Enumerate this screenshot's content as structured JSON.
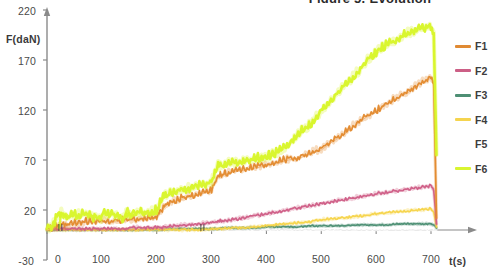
{
  "figure": {
    "title": "Figure 5. Evolution"
  },
  "axes": {
    "y_label": "F(daN)",
    "x_label": "t(s)",
    "y_ticks": [
      "220",
      "170",
      "120",
      "70",
      "20",
      "-30"
    ],
    "x_ticks": [
      "0",
      "100",
      "200",
      "300",
      "400",
      "500",
      "600",
      "700"
    ]
  },
  "legend": {
    "items": [
      {
        "label": "F1",
        "color": "#e08a33"
      },
      {
        "label": "F2",
        "color": "#cc5f86"
      },
      {
        "label": "F3",
        "color": "#4e8f74"
      },
      {
        "label": "F4",
        "color": "#f5d44f"
      },
      {
        "label": "F5",
        "color": "#ffffff"
      },
      {
        "label": "F6",
        "color": "#d9f531"
      }
    ]
  },
  "chart_data": {
    "type": "line",
    "title": "Figure 5. Evolution",
    "xlabel": "t(s)",
    "ylabel": "F(daN)",
    "xlim": [
      0,
      730
    ],
    "ylim": [
      -30,
      220
    ],
    "grid": false,
    "legend_position": "right",
    "x": [
      0,
      10,
      20,
      30,
      40,
      60,
      80,
      100,
      120,
      140,
      160,
      180,
      200,
      210,
      220,
      240,
      260,
      280,
      300,
      310,
      320,
      340,
      360,
      380,
      400,
      420,
      440,
      460,
      480,
      500,
      520,
      540,
      560,
      580,
      600,
      620,
      640,
      660,
      680,
      700,
      705,
      710
    ],
    "series": [
      {
        "name": "F1",
        "color": "#e08a33",
        "values": [
          0,
          1,
          3,
          6,
          5,
          7,
          8,
          8,
          8,
          9,
          10,
          11,
          12,
          20,
          26,
          30,
          33,
          36,
          38,
          52,
          55,
          58,
          60,
          62,
          64,
          67,
          70,
          72,
          76,
          80,
          88,
          95,
          104,
          112,
          118,
          126,
          132,
          138,
          146,
          152,
          148,
          12
        ]
      },
      {
        "name": "F2",
        "color": "#cc5f86",
        "values": [
          0,
          0,
          1,
          1,
          1,
          1,
          1,
          1,
          1,
          1,
          2,
          2,
          2,
          2,
          3,
          4,
          5,
          6,
          7,
          8,
          9,
          10,
          12,
          14,
          16,
          18,
          20,
          22,
          24,
          26,
          28,
          30,
          32,
          34,
          36,
          37,
          39,
          41,
          42,
          44,
          40,
          6
        ]
      },
      {
        "name": "F3",
        "color": "#4e8f74",
        "values": [
          0,
          0,
          0,
          0,
          0,
          0,
          0,
          0,
          0,
          0,
          0,
          0,
          0,
          0,
          1,
          1,
          1,
          1,
          1,
          1,
          2,
          2,
          2,
          2,
          3,
          3,
          3,
          3,
          4,
          4,
          4,
          4,
          5,
          5,
          5,
          5,
          6,
          6,
          6,
          6,
          5,
          2
        ]
      },
      {
        "name": "F4",
        "color": "#f5d44f",
        "values": [
          0,
          0,
          0,
          0,
          0,
          0,
          0,
          0,
          0,
          0,
          0,
          0,
          0,
          0,
          0,
          0,
          0,
          0,
          1,
          1,
          1,
          2,
          2,
          3,
          4,
          5,
          6,
          7,
          8,
          10,
          11,
          12,
          13,
          14,
          16,
          17,
          18,
          19,
          20,
          21,
          18,
          3
        ]
      },
      {
        "name": "F5",
        "color": "#ffffff",
        "values": [
          0,
          0,
          0,
          0,
          0,
          0,
          0,
          0,
          0,
          0,
          0,
          0,
          0,
          0,
          0,
          0,
          0,
          0,
          0,
          0,
          0,
          0,
          0,
          0,
          0,
          0,
          0,
          0,
          0,
          0,
          0,
          0,
          0,
          0,
          0,
          0,
          0,
          0,
          0,
          0,
          0,
          0
        ]
      },
      {
        "name": "F6",
        "color": "#d9f531",
        "values": [
          0,
          2,
          14,
          16,
          13,
          14,
          15,
          14,
          16,
          14,
          15,
          16,
          18,
          30,
          34,
          38,
          40,
          44,
          46,
          62,
          64,
          66,
          68,
          70,
          72,
          76,
          84,
          96,
          104,
          118,
          130,
          142,
          152,
          166,
          176,
          184,
          190,
          196,
          200,
          202,
          196,
          75
        ]
      }
    ]
  }
}
